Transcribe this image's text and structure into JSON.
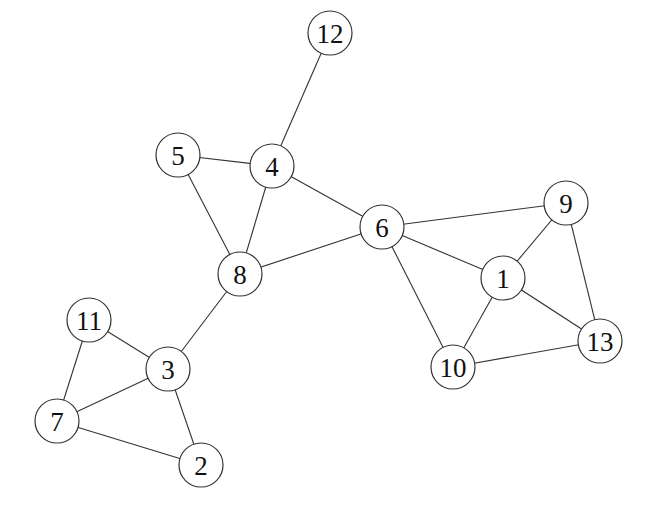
{
  "diagram": {
    "type": "undirected-graph",
    "node_radius": 22,
    "colors": {
      "stroke": "#333333",
      "fill": "#ffffff",
      "text": "#111111",
      "background": "#ffffff"
    },
    "nodes": [
      {
        "id": "1",
        "label": "1",
        "x": 503,
        "y": 278
      },
      {
        "id": "2",
        "label": "2",
        "x": 201,
        "y": 465
      },
      {
        "id": "3",
        "label": "3",
        "x": 168,
        "y": 369
      },
      {
        "id": "4",
        "label": "4",
        "x": 272,
        "y": 166
      },
      {
        "id": "5",
        "label": "5",
        "x": 178,
        "y": 155
      },
      {
        "id": "6",
        "label": "6",
        "x": 382,
        "y": 227
      },
      {
        "id": "7",
        "label": "7",
        "x": 57,
        "y": 421
      },
      {
        "id": "8",
        "label": "8",
        "x": 240,
        "y": 274
      },
      {
        "id": "9",
        "label": "9",
        "x": 566,
        "y": 203
      },
      {
        "id": "10",
        "label": "10",
        "x": 453,
        "y": 367
      },
      {
        "id": "11",
        "label": "11",
        "x": 89,
        "y": 320
      },
      {
        "id": "12",
        "label": "12",
        "x": 330,
        "y": 33
      },
      {
        "id": "13",
        "label": "13",
        "x": 600,
        "y": 341
      }
    ],
    "edges": [
      [
        "12",
        "4"
      ],
      [
        "5",
        "4"
      ],
      [
        "5",
        "8"
      ],
      [
        "4",
        "8"
      ],
      [
        "4",
        "6"
      ],
      [
        "8",
        "6"
      ],
      [
        "8",
        "3"
      ],
      [
        "6",
        "9"
      ],
      [
        "6",
        "1"
      ],
      [
        "6",
        "10"
      ],
      [
        "9",
        "1"
      ],
      [
        "9",
        "13"
      ],
      [
        "1",
        "13"
      ],
      [
        "1",
        "10"
      ],
      [
        "10",
        "13"
      ],
      [
        "11",
        "3"
      ],
      [
        "11",
        "7"
      ],
      [
        "3",
        "7"
      ],
      [
        "3",
        "2"
      ],
      [
        "7",
        "2"
      ]
    ]
  }
}
